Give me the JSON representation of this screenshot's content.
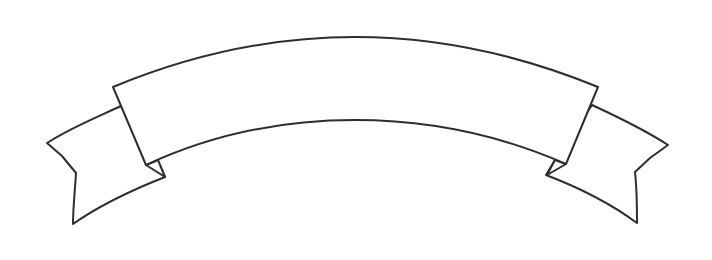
{
  "image": {
    "subject": "ribbon-banner",
    "style": "line-art",
    "background_color": "#ffffff",
    "stroke_color": "#2e2e2e",
    "fill_color": "#ffffff",
    "text": ""
  }
}
